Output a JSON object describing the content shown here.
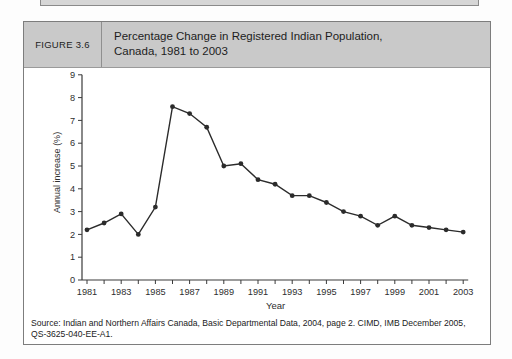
{
  "figure": {
    "label": "FIGURE 3.6",
    "title_line1": "Percentage Change in Registered Indian Population,",
    "title_line2": "Canada, 1981 to 2003",
    "source": "Source: Indian and Northern Affairs Canada, Basic Departmental Data, 2004, page 2. CIMD, IMB December 2005, QS-3625-040-EE-A1."
  },
  "chart_data": {
    "type": "line",
    "x": [
      1981,
      1982,
      1983,
      1984,
      1985,
      1986,
      1987,
      1988,
      1989,
      1990,
      1991,
      1992,
      1993,
      1994,
      1995,
      1996,
      1997,
      1998,
      1999,
      2000,
      2001,
      2002,
      2003
    ],
    "values": [
      2.2,
      2.5,
      2.9,
      2.0,
      3.2,
      7.6,
      7.3,
      6.7,
      5.0,
      5.1,
      4.4,
      4.2,
      3.7,
      3.7,
      3.4,
      3.0,
      2.8,
      2.4,
      2.8,
      2.4,
      2.3,
      2.2,
      2.1
    ],
    "xlabel": "Year",
    "ylabel": "Annual increase (%)",
    "ylim": [
      0,
      9
    ],
    "y_ticks": [
      0,
      1,
      2,
      3,
      4,
      5,
      6,
      7,
      8,
      9
    ],
    "x_tick_labels": [
      1981,
      1983,
      1985,
      1987,
      1989,
      1991,
      1993,
      1995,
      1997,
      1999,
      2001,
      2003
    ],
    "grid": false,
    "legend": "none",
    "line_color": "#2b2b2b",
    "marker": "circle"
  },
  "colors": {
    "header_bg": "#c9c9c9",
    "box_border": "#7d7d7d",
    "line": "#2b2b2b"
  }
}
